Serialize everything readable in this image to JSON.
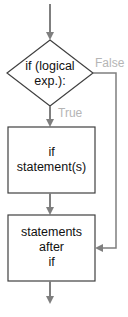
{
  "diagram": {
    "type": "flowchart",
    "decision": {
      "line1": "if (logical",
      "line2": "exp.):"
    },
    "if_box": {
      "line1": "if",
      "line2": "statement(s)"
    },
    "after_box": {
      "line1": "statements",
      "line2": "after",
      "line3": "if"
    },
    "edges": {
      "true_label": "True",
      "false_label": "False"
    },
    "colors": {
      "line": "#7f7f7f",
      "shape_border": "#404040",
      "edge_label": "#b5b5b5",
      "text": "#111111"
    }
  }
}
